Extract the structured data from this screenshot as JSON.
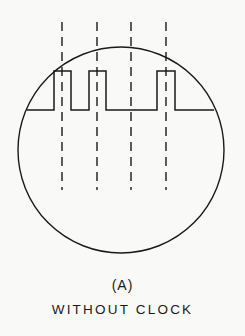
{
  "figure": {
    "label": "(A)",
    "caption": "WITHOUT CLOCK",
    "colors": {
      "stroke": "#1a1a1a",
      "background": "#f9f9f7"
    },
    "circle": {
      "cx": 121,
      "cy": 150,
      "r": 103
    },
    "dashed_lines_x": [
      62,
      97,
      131,
      166
    ],
    "dashed_y_range": [
      22,
      190
    ],
    "waveform": {
      "baseline_y": 110,
      "high_y": 71,
      "x_start": 27,
      "x_end": 214,
      "pulses": [
        [
          54,
          71
        ],
        [
          89,
          106
        ],
        [
          157,
          175
        ]
      ]
    }
  }
}
